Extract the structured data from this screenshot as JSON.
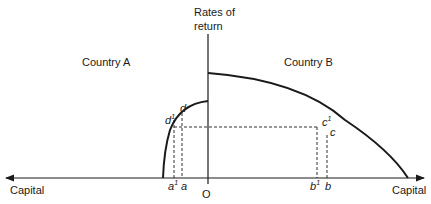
{
  "diagram": {
    "y_axis_label_line1": "Rates of",
    "y_axis_label_line2": "return",
    "x_axis_left_label": "Capital",
    "x_axis_right_label": "Capital",
    "origin_label": "O",
    "region_left_label": "Country A",
    "region_right_label": "Country B",
    "points": {
      "d": "d",
      "d1": "d",
      "d1_sup": "1",
      "c": "c",
      "c1": "c",
      "c1_sup": "1",
      "a": "a",
      "a1": "a",
      "a1_sup": "1",
      "b": "b",
      "b1": "b",
      "b1_sup": "1"
    },
    "colors": {
      "line": "#1a1a1a",
      "background": "#ffffff"
    }
  }
}
